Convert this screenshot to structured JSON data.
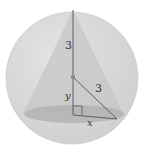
{
  "diagram": {
    "labels": {
      "upper_segment": "3",
      "radius_segment": "3",
      "height_variable": "y",
      "base_radius_variable": "x"
    },
    "colors": {
      "background": "#ffffff",
      "sphere_fill": "#d9d9d9",
      "sphere_edge": "#c8c8c8",
      "cone_fill": "#c4c4c4",
      "base_fill": "#b5b5b5",
      "line": "#555555",
      "center_dot": "#888888"
    }
  }
}
